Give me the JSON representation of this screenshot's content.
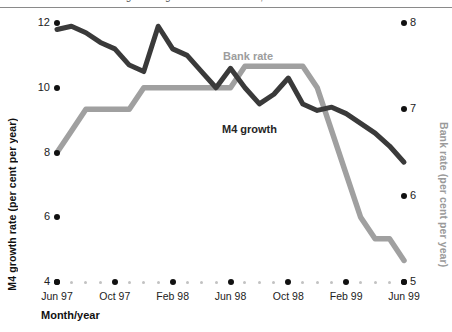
{
  "figure": {
    "cutoff_caption": "Figure  M4 growth and Bank rate, Jun 97 - Jun 99",
    "background": "#ffffff"
  },
  "axes": {
    "left": {
      "title": "M4 growth rate (per cent per year)",
      "ticks": [
        "12",
        "10",
        "8",
        "6",
        "4"
      ],
      "values": [
        12,
        10,
        8,
        6,
        4
      ],
      "range": [
        4,
        12
      ],
      "color": "#111111"
    },
    "right": {
      "title": "Bank rate (per cent per year)",
      "ticks": [
        "8",
        "7",
        "6",
        "5"
      ],
      "values": [
        8,
        7,
        6,
        5
      ],
      "range": [
        5,
        8
      ],
      "color": "#9a9a9a"
    },
    "x": {
      "title": "Month/year",
      "ticks": [
        "Jun 97",
        "Oct 97",
        "Feb 98",
        "Jun 98",
        "Oct 98",
        "Feb 99",
        "Jun 99"
      ],
      "minor_ticks_between": 3
    }
  },
  "legend": {
    "bank_rate_label": "Bank rate",
    "m4_growth_label": "M4 growth"
  },
  "colors": {
    "m4_line": "#3a3a3a",
    "bank_line": "#a0a0a0",
    "tick_dot": "#111111",
    "minor_dot": "#c2c2c2",
    "rule": "#8a8a8a"
  },
  "chart_data": {
    "type": "line",
    "title": "M4 growth and Bank rate",
    "xlabel": "Month/year",
    "ylabel": "M4 growth rate (per cent per year)",
    "y2label": "Bank rate (per cent per year)",
    "ylim": [
      4,
      12
    ],
    "y2lim": [
      5,
      8
    ],
    "grid": false,
    "legend_position": "inline-annotations",
    "x": [
      "Jun 97",
      "Jul 97",
      "Aug 97",
      "Sep 97",
      "Oct 97",
      "Nov 97",
      "Dec 97",
      "Jan 98",
      "Feb 98",
      "Mar 98",
      "Apr 98",
      "May 98",
      "Jun 98",
      "Jul 98",
      "Aug 98",
      "Sep 98",
      "Oct 98",
      "Nov 98",
      "Dec 98",
      "Jan 99",
      "Feb 99",
      "Mar 99",
      "Apr 99",
      "May 99",
      "Jun 99"
    ],
    "series": [
      {
        "name": "M4 growth",
        "axis": "left",
        "color": "#3a3a3a",
        "units": "per cent per year",
        "values": [
          11.8,
          11.9,
          11.7,
          11.4,
          11.2,
          10.7,
          10.5,
          11.9,
          11.2,
          11.0,
          10.5,
          10.0,
          10.6,
          10.0,
          9.5,
          9.8,
          10.3,
          9.5,
          9.3,
          9.4,
          9.2,
          8.9,
          8.6,
          8.2,
          7.7
        ]
      },
      {
        "name": "Bank rate",
        "axis": "right",
        "color": "#a0a0a0",
        "units": "per cent per year",
        "values": [
          6.5,
          6.75,
          7.0,
          7.0,
          7.0,
          7.0,
          7.25,
          7.25,
          7.25,
          7.25,
          7.25,
          7.25,
          7.25,
          7.5,
          7.5,
          7.5,
          7.5,
          7.5,
          7.25,
          6.75,
          6.25,
          5.75,
          5.5,
          5.5,
          5.25
        ]
      }
    ]
  }
}
